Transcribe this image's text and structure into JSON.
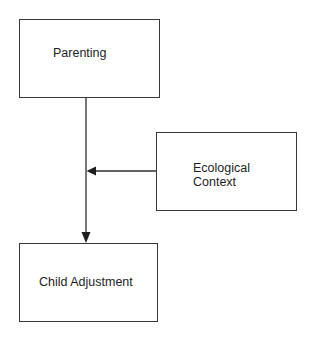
{
  "diagram": {
    "type": "path-model",
    "nodes": [
      {
        "id": "parenting",
        "label": "Parenting"
      },
      {
        "id": "ecological_context",
        "label": "Ecological\nContext"
      },
      {
        "id": "child_adjustment",
        "label": "Child Adjustment"
      }
    ],
    "edges": [
      {
        "from": "parenting",
        "to": "child_adjustment",
        "kind": "direct-effect"
      },
      {
        "from": "ecological_context",
        "to": "parenting->child_adjustment",
        "kind": "moderation"
      }
    ],
    "colors": {
      "stroke": "#3a3a3a",
      "text": "#1e1e1e",
      "background": "#ffffff"
    }
  }
}
